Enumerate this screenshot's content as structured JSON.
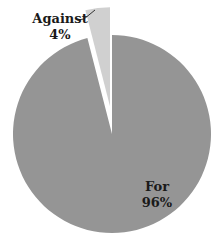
{
  "chart_data": {
    "type": "pie",
    "title": "",
    "slices": [
      {
        "label": "For",
        "value": 96,
        "display": "96%",
        "color": "#959595",
        "exploded": false
      },
      {
        "label": "Against",
        "value": 4,
        "display": "4%",
        "color": "#d0d0d0",
        "exploded": true
      }
    ],
    "start_angle_deg": 0,
    "direction": "clockwise",
    "legend": "none",
    "labels": {
      "for_name": "For",
      "for_pct": "96%",
      "against_name": "Against",
      "against_pct": "4%"
    }
  }
}
